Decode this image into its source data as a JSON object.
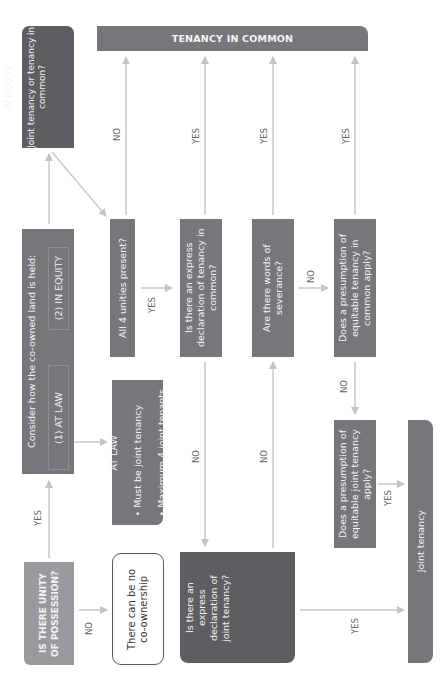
{
  "diagram": {
    "orientation": "rotated 90° counter-clockwise (text reads bottom-to-top)",
    "nodes": {
      "unity_possession": "IS THERE UNITY OF POSSESSION?",
      "no_coownership": "There can be no co-ownership",
      "consider": {
        "title": "Consider how the co-owned land is held:",
        "option_law": "(1) AT LAW",
        "option_equity": "(2) IN EQUITY"
      },
      "at_law": {
        "title": "AT LAW",
        "bullets": [
          "Must be joint tenancy",
          "Maximum 4 joint tenants"
        ]
      },
      "in_equity": {
        "title": "IN EQUITY",
        "question": "Joint tenancy or tenancy in common?"
      },
      "four_unities": "All 4 unities present?",
      "express_tic": "Is there an express declaration of tenancy in common?",
      "severance": "Are there words of severance?",
      "presumption_tic": "Does a presumption of equitable tenancy in common apply?",
      "express_jt": "Is there an express declaration of joint tenancy?",
      "presumption_jt": "Does a presumption of equitable joint tenancy apply?",
      "tenancy_in_common": "TENANCY IN COMMON",
      "joint_tenancy": "Joint tenancy"
    },
    "edge_labels": {
      "possession_yes": "YES",
      "possession_no": "NO",
      "unities_no": "NO",
      "unities_yes": "YES",
      "express_tic_yes": "YES",
      "express_tic_no": "NO",
      "severance_yes": "YES",
      "severance_no": "NO",
      "presumption_tic_yes": "YES",
      "presumption_tic_no": "NO",
      "express_jt_no": "NO",
      "express_jt_yes": "YES",
      "presumption_jt_yes": "YES"
    },
    "colors": {
      "dark_box": "#5e5e62",
      "mid_box": "#77777b",
      "light_box": "#9a9a9e",
      "arrow": "#c4c4c8",
      "label": "#666666"
    }
  }
}
